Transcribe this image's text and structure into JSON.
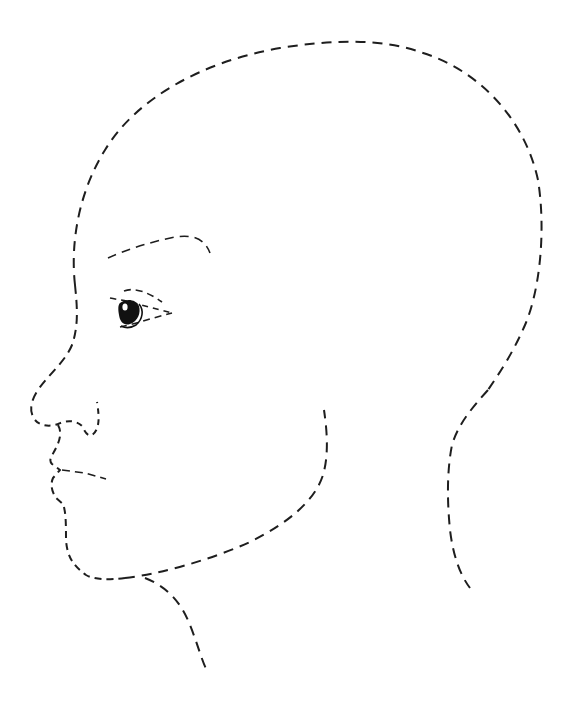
{
  "illustration": {
    "subject": "Dashed-line outline of a human head in left-facing profile",
    "caption": "",
    "colors": {
      "background": "#ffffff",
      "stroke": "#1e1e1e",
      "pupil": "#111111",
      "highlight": "#ffffff"
    },
    "stroke": {
      "dash": "9 6",
      "dash_fine": "7 5"
    },
    "parts": [
      "skull-outline",
      "forehead-nose-profile",
      "nose",
      "lips-chin",
      "jaw-line",
      "cheek-line",
      "neck-front",
      "neck-back",
      "eyebrow",
      "eye"
    ]
  }
}
